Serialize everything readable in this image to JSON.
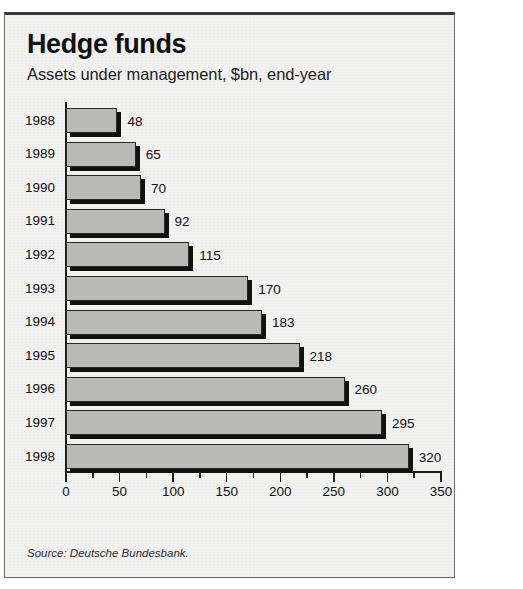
{
  "figure": {
    "title": "Hedge funds",
    "subtitle": "Assets under management, $bn, end-year",
    "source": "Source: Deutsche Bundesbank.",
    "colors": {
      "bar_fill": "#b9b9b7",
      "bar_edge": "#262626",
      "bar_shadow": "#111111",
      "panel_bg": "#f2f2f0",
      "text": "#111111",
      "frame": "#6e6e6e"
    }
  },
  "chart_data": {
    "type": "bar",
    "orientation": "horizontal",
    "title": "Hedge funds",
    "subtitle": "Assets under management, $bn, end-year",
    "xlabel": "",
    "ylabel": "",
    "units": "$bn",
    "categories": [
      "1988",
      "1989",
      "1990",
      "1991",
      "1992",
      "1993",
      "1994",
      "1995",
      "1996",
      "1997",
      "1998"
    ],
    "values": [
      48,
      65,
      70,
      92,
      115,
      170,
      183,
      218,
      260,
      295,
      320
    ],
    "data_labels": [
      "48",
      "65",
      "70",
      "92",
      "115",
      "170",
      "183",
      "218",
      "260",
      "295",
      "320"
    ],
    "xlim": [
      0,
      350
    ],
    "xticks": [
      0,
      50,
      100,
      150,
      200,
      250,
      300,
      350
    ],
    "xtick_labels": [
      "0",
      "50",
      "100",
      "150",
      "200",
      "250",
      "300",
      "350"
    ],
    "minor_tick_step": 25,
    "grid": false,
    "legend": false,
    "source": "Source: Deutsche Bundesbank."
  }
}
